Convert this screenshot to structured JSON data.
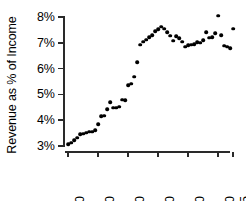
{
  "chart_data": {
    "type": "scatter",
    "title": "",
    "xlabel": "",
    "ylabel": "Revenue as % of Income",
    "xlim": [
      1949,
      2006
    ],
    "ylim": [
      3,
      8
    ],
    "xticks": [
      1950,
      1960,
      1970,
      1980,
      1990,
      2000,
      2005
    ],
    "xtick_labels": [
      "1950",
      "1960",
      "1970",
      "1980",
      "1990",
      "2000",
      "2005"
    ],
    "yticks": [
      3,
      4,
      5,
      6,
      7,
      8
    ],
    "ytick_labels": [
      "3%",
      "4%",
      "5%",
      "6%",
      "7%",
      "8%"
    ],
    "grid": false,
    "legend": false,
    "marker": "filled-circle",
    "marker_color": "#000000",
    "x": [
      1950,
      1951,
      1952,
      1953,
      1954,
      1955,
      1956,
      1957,
      1958,
      1959,
      1960,
      1961,
      1962,
      1963,
      1964,
      1965,
      1966,
      1967,
      1968,
      1969,
      1970,
      1971,
      1972,
      1973,
      1974,
      1975,
      1976,
      1977,
      1978,
      1979,
      1980,
      1981,
      1982,
      1983,
      1984,
      1985,
      1986,
      1987,
      1988,
      1989,
      1990,
      1991,
      1992,
      1993,
      1994,
      1995,
      1996,
      1997,
      1998,
      1999,
      2000,
      2001,
      2002,
      2003,
      2004,
      2005
    ],
    "y": [
      3.08,
      3.12,
      3.22,
      3.32,
      3.45,
      3.48,
      3.52,
      3.55,
      3.55,
      3.62,
      3.85,
      4.15,
      4.18,
      4.42,
      4.7,
      4.48,
      4.48,
      4.52,
      4.8,
      4.78,
      5.35,
      5.42,
      5.68,
      6.25,
      6.92,
      7.05,
      7.12,
      7.22,
      7.3,
      7.45,
      7.52,
      7.62,
      7.55,
      7.42,
      7.28,
      7.08,
      7.25,
      7.18,
      7.05,
      6.85,
      6.9,
      6.92,
      6.95,
      7.02,
      7.0,
      7.1,
      7.42,
      7.2,
      7.22,
      7.38,
      8.05,
      7.3,
      6.88,
      6.85,
      6.8,
      7.55
    ],
    "series": [
      {
        "name": "Revenue as % of Income",
        "points": [
          [
            1950,
            3.08
          ],
          [
            1951,
            3.12
          ],
          [
            1952,
            3.22
          ],
          [
            1953,
            3.32
          ],
          [
            1954,
            3.45
          ],
          [
            1955,
            3.48
          ],
          [
            1956,
            3.52
          ],
          [
            1957,
            3.55
          ],
          [
            1958,
            3.55
          ],
          [
            1959,
            3.62
          ],
          [
            1960,
            3.85
          ],
          [
            1961,
            4.15
          ],
          [
            1962,
            4.18
          ],
          [
            1963,
            4.42
          ],
          [
            1964,
            4.7
          ],
          [
            1965,
            4.48
          ],
          [
            1966,
            4.48
          ],
          [
            1967,
            4.52
          ],
          [
            1968,
            4.8
          ],
          [
            1969,
            4.78
          ],
          [
            1970,
            5.35
          ],
          [
            1971,
            5.42
          ],
          [
            1972,
            5.68
          ],
          [
            1973,
            6.25
          ],
          [
            1974,
            6.92
          ],
          [
            1975,
            7.05
          ],
          [
            1976,
            7.12
          ],
          [
            1977,
            7.22
          ],
          [
            1978,
            7.3
          ],
          [
            1979,
            7.45
          ],
          [
            1980,
            7.52
          ],
          [
            1981,
            7.62
          ],
          [
            1982,
            7.55
          ],
          [
            1983,
            7.42
          ],
          [
            1984,
            7.28
          ],
          [
            1985,
            7.08
          ],
          [
            1986,
            7.25
          ],
          [
            1987,
            7.18
          ],
          [
            1988,
            7.05
          ],
          [
            1989,
            6.85
          ],
          [
            1990,
            6.9
          ],
          [
            1991,
            6.92
          ],
          [
            1992,
            6.95
          ],
          [
            1993,
            7.02
          ],
          [
            1994,
            7.0
          ],
          [
            1995,
            7.1
          ],
          [
            1996,
            7.42
          ],
          [
            1997,
            7.2
          ],
          [
            1998,
            7.22
          ],
          [
            1999,
            7.38
          ],
          [
            2000,
            8.05
          ],
          [
            2001,
            7.3
          ],
          [
            2002,
            6.88
          ],
          [
            2003,
            6.85
          ],
          [
            2004,
            6.8
          ],
          [
            2005,
            7.55
          ]
        ]
      }
    ]
  }
}
